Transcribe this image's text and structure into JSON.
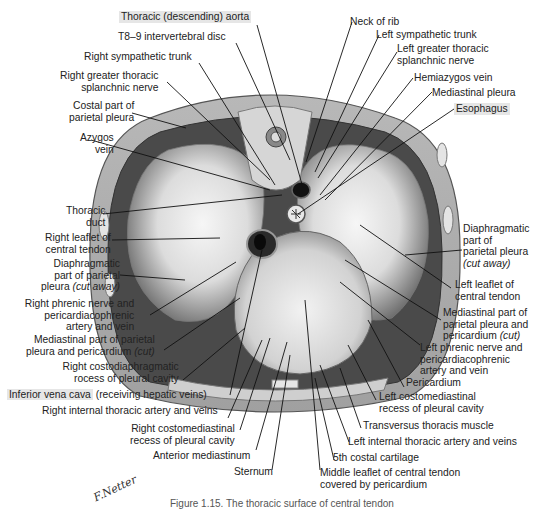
{
  "figure": {
    "caption": "Figure 1.15. The thoracic surface of central tendon",
    "signature": "F.Netter",
    "colors": {
      "background": "#ffffff",
      "label_text": "#222222",
      "highlight": "#e6e6e6",
      "leader_line": "#111111",
      "illustration_dark": "#3a3a3a",
      "illustration_mid": "#9a9a9a",
      "illustration_light": "#e8e8e8"
    }
  },
  "labels": {
    "aorta": "Thoracic (descending) aorta",
    "disc": "T8–9 intervertebral disc",
    "r_symp": "Right sympathetic trunk",
    "r_splanch_1": "Right greater thoracic",
    "r_splanch_2": "splanchnic nerve",
    "costal_1": "Costal part of",
    "costal_2": "parietal pleura",
    "azygos_1": "Azygos",
    "azygos_2": "vein",
    "duct_1": "Thoracic",
    "duct_2": "duct",
    "r_leaflet_1": "Right leaflet of",
    "r_leaflet_2": "central tendon",
    "r_diaph_1": "Diaphragmatic",
    "r_diaph_2": "part of parietal",
    "r_diaph_3a": "pleura ",
    "r_diaph_3b": "(cut away)",
    "r_phrenic_1": "Right phrenic nerve and",
    "r_phrenic_2": "pericardiacophrenic",
    "r_phrenic_3": "artery and vein",
    "r_mediast_1": "Mediastinal part of parietal",
    "r_mediast_2a": "pleura and pericardium ",
    "r_mediast_2b": "(cut)",
    "r_costodiaph_1": "Right costodiaphragmatic",
    "r_costodiaph_2": "rocess of pleural cavity",
    "ivc": "Inferior vena cava",
    "ivc_2": " (receiving hepatic veins)",
    "r_int_thor": "Right internal thoracic artery and veins",
    "r_costomed_1": "Right costomediastinal",
    "r_costomed_2": "recess of pleural cavity",
    "ant_mediast": "Anterior mediastinum",
    "sternum": "Sternum",
    "neck_rib": "Neck of rib",
    "l_symp": "Left sympathetic trunk",
    "l_splanch_1": "Left greater thoracic",
    "l_splanch_2": "splanchnic nerve",
    "hemiazygos": "Hemiazygos vein",
    "mediast_pleura": "Mediastinal pleura",
    "esophagus": "Esophagus",
    "l_diaph_1": "Diaphragmatic",
    "l_diaph_2": "part of",
    "l_diaph_3": "parietal pleura",
    "l_diaph_4": "(cut away)",
    "l_leaflet_1": "Left leaflet of",
    "l_leaflet_2": "central tendon",
    "l_mediast_1": "Mediastinal part of",
    "l_mediast_2": "parietal pleura and",
    "l_mediast_3a": "pericardium ",
    "l_mediast_3b": "(cut)",
    "l_phrenic_1": "Left phrenic nerve and",
    "l_phrenic_2": "pericardiacophrenic",
    "l_phrenic_3": "artery and vein",
    "pericardium": "Pericardium",
    "l_costomed_1": "Left costomediastinal",
    "l_costomed_2": "recess of pleural cavity",
    "transversus": "Transversus thoracis muscle",
    "l_int_thor": "Left internal thoracic artery and veins",
    "costal_cart": "5th costal cartilage",
    "middle_leaflet_1": "Middle leaflet of central tendon",
    "middle_leaflet_2": "covered by pericardium"
  }
}
